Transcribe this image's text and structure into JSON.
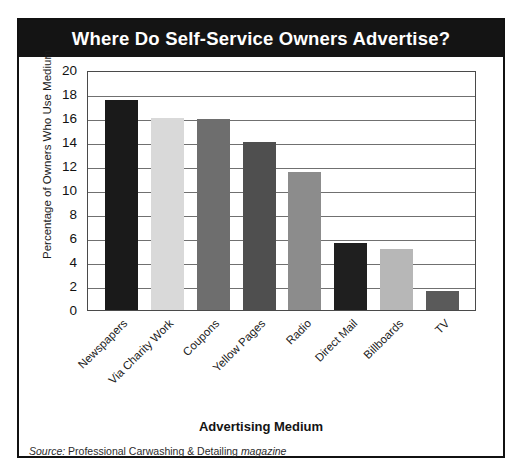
{
  "figure": {
    "title": "Where Do Self-Service Owners Advertise?",
    "source_prefix": "Source:",
    "source_body": "Professional Carwashing & Detailing",
    "source_suffix": "magazine"
  },
  "chart_data": {
    "type": "bar",
    "title": "Where Do Self-Service Owners Advertise?",
    "xlabel": "Advertising Medium",
    "ylabel": "Percentage of Owners Who Use Medium",
    "ylim": [
      0,
      20
    ],
    "ytick_labels": [
      "20",
      "18",
      "16",
      "14",
      "12",
      "10",
      "8",
      "6",
      "4",
      "2",
      "0"
    ],
    "ytick_values": [
      20,
      18,
      16,
      14,
      12,
      10,
      8,
      6,
      4,
      2,
      0
    ],
    "grid": true,
    "legend": false,
    "categories": [
      "Newspapers",
      "Via Charity Work",
      "Coupons",
      "Yellow Pages",
      "Radio",
      "Direct Mail",
      "Billboards",
      "TV"
    ],
    "values": [
      17.5,
      16.0,
      15.9,
      14.0,
      11.5,
      5.6,
      5.1,
      1.6
    ],
    "bar_colors": [
      "#1a1a1a",
      "#d9d9d9",
      "#6e6e6e",
      "#4f4f4f",
      "#8c8c8c",
      "#1f1f1f",
      "#b7b7b7",
      "#5a5a5a"
    ]
  },
  "colors": {
    "banner_background": "#141414",
    "banner_text": "#ffffff",
    "frame_border": "#111111",
    "gridline": "#707070",
    "plot_background": "#ffffff"
  }
}
